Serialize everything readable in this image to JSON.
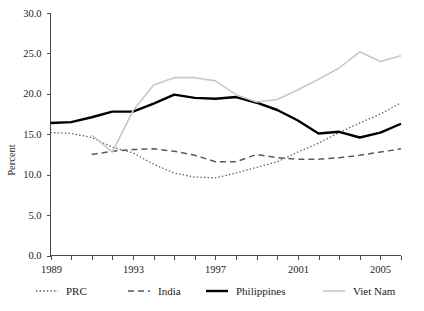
{
  "chart_data": {
    "type": "line",
    "title": "",
    "subtitle": "",
    "xlabel": "",
    "ylabel": "Percent",
    "xlim": [
      1989,
      2006
    ],
    "ylim": [
      0.0,
      30.0
    ],
    "grid": false,
    "legend_position": "bottom",
    "x": [
      1989,
      1990,
      1991,
      1992,
      1993,
      1994,
      1995,
      1996,
      1997,
      1998,
      1999,
      2000,
      2001,
      2002,
      2003,
      2004,
      2005,
      2006
    ],
    "xtick_values": [
      1989,
      1990,
      1991,
      1992,
      1993,
      1994,
      1995,
      1996,
      1997,
      1998,
      1999,
      2000,
      2001,
      2002,
      2003,
      2004,
      2005,
      2006
    ],
    "xtick_labels": [
      "1989",
      "",
      "",
      "",
      "1993",
      "",
      "",
      "",
      "1997",
      "",
      "",
      "",
      "2001",
      "",
      "",
      "",
      "2005",
      ""
    ],
    "ytick_values": [
      0.0,
      5.0,
      10.0,
      15.0,
      20.0,
      25.0,
      30.0
    ],
    "ytick_labels": [
      "0.0",
      "5.0",
      "10.0",
      "15.0",
      "20.0",
      "25.0",
      "30.0"
    ],
    "series": [
      {
        "name": "PRC",
        "style": "dotted",
        "color": "#5a5a5a",
        "width": 1.3,
        "x": [
          1989,
          1990,
          1991,
          1992,
          1993,
          1994,
          1995,
          1996,
          1997,
          1998,
          1999,
          2000,
          2001,
          2002,
          2003,
          2004,
          2005,
          2006
        ],
        "values": [
          15.2,
          15.1,
          14.6,
          13.4,
          12.7,
          11.3,
          10.2,
          9.7,
          9.6,
          10.2,
          10.9,
          11.6,
          12.8,
          13.9,
          15.2,
          16.4,
          17.5,
          18.9
        ]
      },
      {
        "name": "India",
        "style": "dashed",
        "color": "#5a5a5a",
        "width": 1.5,
        "x": [
          1991,
          1992,
          1993,
          1994,
          1995,
          1996,
          1997,
          1998,
          1999,
          2000,
          2001,
          2002,
          2003,
          2004,
          2005,
          2006
        ],
        "values": [
          12.5,
          12.9,
          13.1,
          13.2,
          12.9,
          12.4,
          11.6,
          11.6,
          12.5,
          12.1,
          11.9,
          11.9,
          12.1,
          12.4,
          12.8,
          13.2
        ]
      },
      {
        "name": "Philippines",
        "style": "solid",
        "color": "#000000",
        "width": 2.4,
        "x": [
          1989,
          1990,
          1991,
          1992,
          1993,
          1994,
          1995,
          1996,
          1997,
          1998,
          1999,
          2000,
          2001,
          2002,
          2003,
          2004,
          2005,
          2006
        ],
        "values": [
          16.4,
          16.5,
          17.1,
          17.8,
          17.8,
          18.8,
          19.9,
          19.5,
          19.4,
          19.6,
          18.9,
          18.0,
          16.7,
          15.1,
          15.3,
          14.6,
          15.2,
          16.3
        ]
      },
      {
        "name": "Viet Nam",
        "style": "solid",
        "color": "#c8c8c8",
        "width": 1.6,
        "x": [
          1991,
          1992,
          1993,
          1994,
          1995,
          1996,
          1997,
          1998,
          1999,
          2000,
          2001,
          2002,
          2003,
          2004,
          2005,
          2006
        ],
        "values": [
          14.9,
          12.8,
          17.9,
          21.1,
          22.0,
          22.0,
          21.6,
          19.9,
          19.0,
          19.3,
          20.5,
          21.8,
          23.2,
          25.2,
          24.0,
          24.7
        ]
      }
    ]
  },
  "axis": {
    "y_title": "Percent"
  },
  "legend": {
    "items": [
      {
        "label": "PRC",
        "swatch": "dotted-line-swatch"
      },
      {
        "label": "India",
        "swatch": "dashed-line-swatch"
      },
      {
        "label": "Philippines",
        "swatch": "solid-bold-line-swatch"
      },
      {
        "label": "Viet Nam",
        "swatch": "solid-light-line-swatch"
      }
    ]
  }
}
